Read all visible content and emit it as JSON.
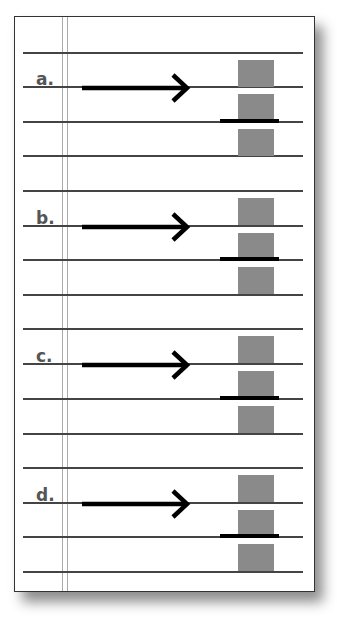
{
  "diagram": {
    "colors": {
      "paper": "#ffffff",
      "border": "#333333",
      "rule_lines": "#444444",
      "margin_lines": "#aaaaaa",
      "label_text": "#555555",
      "arrow": "#000000",
      "gray_block": "#8a8a8a",
      "bar": "#000000"
    },
    "sections": [
      {
        "label": "a."
      },
      {
        "label": "b."
      },
      {
        "label": "c."
      },
      {
        "label": "d."
      }
    ]
  }
}
